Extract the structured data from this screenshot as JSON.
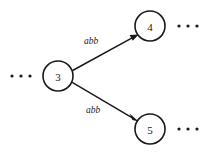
{
  "figure": {
    "type": "state-transition-diagram",
    "background_color": "#ffffff",
    "ink_color": "#1a1a1a"
  },
  "states": [
    {
      "id": "3",
      "label": "3",
      "cx": 58,
      "cy": 76,
      "r": 15
    },
    {
      "id": "4",
      "label": "4",
      "cx": 150,
      "cy": 26,
      "r": 15
    },
    {
      "id": "5",
      "label": "5",
      "cx": 150,
      "cy": 129,
      "r": 15
    }
  ],
  "transitions": [
    {
      "id": "t3-4",
      "from": "3",
      "to": "4",
      "label": "abb",
      "label_x": 91,
      "label_y": 41
    },
    {
      "id": "t3-5",
      "from": "3",
      "to": "5",
      "label": "abb",
      "label_x": 93,
      "label_y": 110
    }
  ],
  "ellipses": [
    {
      "id": "left-of-3",
      "text": "· · ·",
      "cx": 21,
      "cy": 76
    },
    {
      "id": "right-of-4",
      "text": "· · ·",
      "cx": 188,
      "cy": 26
    },
    {
      "id": "right-of-5",
      "text": "· · ·",
      "cx": 188,
      "cy": 129
    }
  ]
}
